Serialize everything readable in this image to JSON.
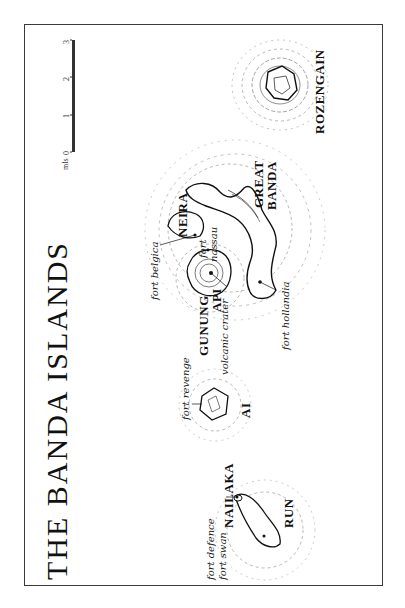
{
  "map": {
    "title": "THE BANDA ISLANDS",
    "scale": {
      "unit": "mls",
      "ticks": [
        "0",
        "1",
        "2",
        "3"
      ]
    },
    "islands": [
      {
        "id": "rozengain",
        "label": "ROZENGAIN"
      },
      {
        "id": "great-banda",
        "label_line1": "GREAT",
        "label_line2": "BANDA"
      },
      {
        "id": "neira",
        "label": "NEIRA"
      },
      {
        "id": "gunung-api",
        "label_line1": "GUNUNG",
        "label_line2": "API"
      },
      {
        "id": "ai",
        "label": "AI"
      },
      {
        "id": "nailaka",
        "label": "NAILAKA"
      },
      {
        "id": "run",
        "label": "RUN"
      }
    ],
    "features": {
      "fort_belgica": "fort belgica",
      "fort_nassau_line1": "fort",
      "fort_nassau_line2": "nassau",
      "fort_hollandia": "fort hollandia",
      "volcanic_crater": "volcanic crater",
      "fort_revenge": "fort revenge",
      "fort_defence": "fort defence",
      "fort_swan": "fort swan"
    },
    "colors": {
      "ink": "#1a1a1a",
      "contour": "#555555",
      "background": "#ffffff"
    }
  }
}
